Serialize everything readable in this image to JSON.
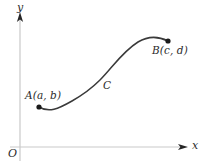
{
  "figure": {
    "width": 204,
    "height": 165,
    "background": "#ffffff",
    "axis_color": "#c9c9c9",
    "arrow_color": "#262626",
    "curve_color": "#3a3a3a",
    "point_color": "#1a1a1a",
    "text_color": "#2b2b2b"
  },
  "axes": {
    "y_axis_label": "y",
    "x_axis_label": "x",
    "origin_label": "O"
  },
  "labels": {
    "point_a": "A(a, b)",
    "point_b": "B(c, d)",
    "curve": "C"
  },
  "chart_data": {
    "type": "line",
    "title": "",
    "xlabel": "x",
    "ylabel": "y",
    "grid": false,
    "legend": null,
    "annotations": [
      {
        "text": "A(a, b)",
        "x": 39,
        "y": 107,
        "role": "start-point-label"
      },
      {
        "text": "B(c, d)",
        "x": 168,
        "y": 41,
        "role": "end-point-label"
      },
      {
        "text": "C",
        "x": 107,
        "y": 88,
        "role": "curve-label"
      },
      {
        "text": "O",
        "x": 20,
        "y": 147,
        "role": "origin-label"
      }
    ],
    "points": [
      {
        "name": "A",
        "px": 39,
        "py": 107
      },
      {
        "name": "B",
        "px": 168,
        "py": 41
      }
    ],
    "curve_path": "M 39 107 C 49 113, 58 109, 72 101 C 86 93, 92 88, 100 80 C 112 68, 122 52, 138 42 C 148 36, 158 36, 168 41",
    "axis_lines": {
      "y_axis": {
        "x": 20,
        "y_top": 15,
        "y_bottom": 161
      },
      "x_axis": {
        "y": 147,
        "x_left": 10,
        "x_right": 184
      }
    }
  }
}
